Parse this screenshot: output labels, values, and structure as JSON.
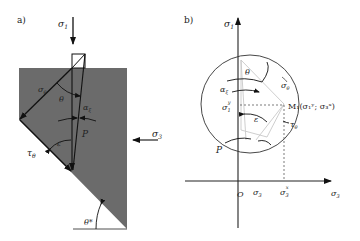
{
  "panel_a": {
    "label": "a)",
    "sigma1": "σ",
    "sigma1_sub": "1",
    "sigma_theta": "σ",
    "sigma_theta_sub": "θ",
    "theta": "θ",
    "alpha_xi": "α",
    "alpha_xi_sub": "ξ",
    "epsilon": "ε",
    "P": "P",
    "tau_theta": "τ",
    "tau_theta_sub": "θ",
    "sigma3": "σ",
    "sigma3_sub": "3",
    "theta_star": "θ*",
    "colors": {
      "block": "#6b6b6b",
      "line": "#111111"
    }
  },
  "panel_b": {
    "label": "b)",
    "y_axis": "σ",
    "y_axis_sub": "1",
    "theta": "θ",
    "sigma_theta": "σ",
    "sigma_theta_sub": "θ",
    "alpha_xi": "α",
    "alpha_xi_sub": "ξ",
    "sigma1y": "σ",
    "sigma1y_sub": "1",
    "sigma1y_sup": "y",
    "M1": "M₁(σ₁ʸ; σ₃ˣ)",
    "epsilon": "ε",
    "tau_theta": "τ",
    "tau_theta_sub": "θ",
    "P": "P",
    "origin": "O",
    "sigma3_tick": "σ",
    "sigma3_tick_sub": "3",
    "sigma3x": "σ",
    "sigma3x_sub": "3",
    "sigma3x_sup": "x",
    "x_axis": "σ",
    "x_axis_sub": "3"
  }
}
